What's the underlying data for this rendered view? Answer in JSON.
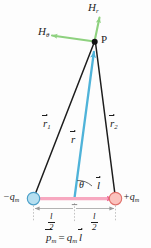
{
  "figure": {
    "point_label": "P",
    "angle_label": "θ"
  },
  "field_components": [
    {
      "name": "H-radial",
      "label": "H",
      "subscript": "r",
      "color": "#8ed17f",
      "direction": "up-right"
    },
    {
      "name": "H-theta",
      "label": "H",
      "subscript": "θ",
      "color": "#8ed17f",
      "direction": "left"
    }
  ],
  "charges": [
    {
      "name": "negative-magnetic-charge",
      "label": "−q",
      "subscript": "m",
      "color": "#a8d8ee",
      "stroke": "#4a9fc8"
    },
    {
      "name": "positive-magnetic-charge",
      "label": "+q",
      "subscript": "m",
      "color": "#f9b9b4",
      "stroke": "#e0706a"
    }
  ],
  "vectors": [
    {
      "name": "r1",
      "label": "r",
      "subscript": "1",
      "color": "#1d1d1d"
    },
    {
      "name": "r",
      "label": "r",
      "subscript": "",
      "color": "#4fb3d9"
    },
    {
      "name": "r2",
      "label": "r",
      "subscript": "2",
      "color": "#1d1d1d"
    },
    {
      "name": "l",
      "label": "l",
      "subscript": "",
      "color": "#f06292"
    }
  ],
  "dimensions": [
    {
      "name": "half-length-left",
      "numerator": "l",
      "denominator": "2"
    },
    {
      "name": "half-length-right",
      "numerator": "l",
      "denominator": "2"
    }
  ],
  "formula": {
    "p_symbol": "p",
    "p_subscript": "m",
    "equals": "=",
    "q_symbol": "q",
    "q_subscript": "m",
    "l_symbol": "l"
  },
  "colors": {
    "green": "#8ed17f",
    "blue": "#4fb3d9",
    "pink": "#f06292",
    "black": "#1d1d1d",
    "gray": "#9a9a9a"
  }
}
